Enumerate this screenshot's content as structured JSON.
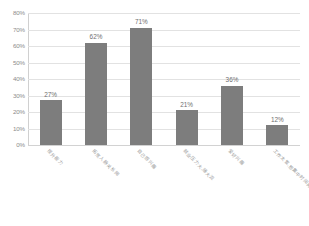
{
  "chart_data": {
    "type": "bar",
    "title": "",
    "xlabel": "",
    "ylabel": "",
    "ylim": [
      0,
      80
    ],
    "y_ticks": [
      "0%",
      "10%",
      "20%",
      "30%",
      "40%",
      "50%",
      "60%",
      "70%",
      "80%"
    ],
    "grid": true,
    "legend": "none",
    "orientation": "vertical",
    "bar_color": "#7d7d7d",
    "gridline_color": "#e2e2e2",
    "categories": [
      "提升能力",
      "拓宽人脉关系网",
      "自己感兴趣",
      "就业压力大,随大流",
      "爱好兴趣",
      "工作太累,想集中时间再一次性放松"
    ],
    "values": [
      27,
      62,
      71,
      21,
      36,
      12
    ],
    "value_labels": [
      "27%",
      "62%",
      "71%",
      "21%",
      "36%",
      "12%"
    ]
  }
}
